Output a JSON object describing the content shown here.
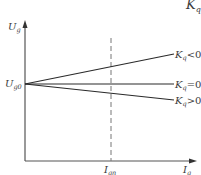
{
  "diagram": {
    "corner_fragment": {
      "main": "K",
      "sub": "q"
    },
    "y_axis": {
      "label_main": "U",
      "label_sub": "g"
    },
    "x_axis": {
      "label_main": "I",
      "label_sub": "g"
    },
    "origin_label": {
      "main": "U",
      "sub": "g0"
    },
    "marker": {
      "label_main": "I",
      "label_sub": "gn",
      "style": "dashed"
    },
    "lines": [
      {
        "name": "kq-negative",
        "label_main": "K",
        "label_sub": "q",
        "relation": "<0",
        "slope": "rising"
      },
      {
        "name": "kq-zero",
        "label_main": "K",
        "label_sub": "q",
        "relation": "=0",
        "slope": "flat"
      },
      {
        "name": "kq-positive",
        "label_main": "K",
        "label_sub": "q",
        "relation": ">0",
        "slope": "falling"
      }
    ],
    "colors": {
      "axis": "#555555",
      "line": "#2a2a2a",
      "dashed": "#777777",
      "text": "#3a3a3a"
    }
  }
}
